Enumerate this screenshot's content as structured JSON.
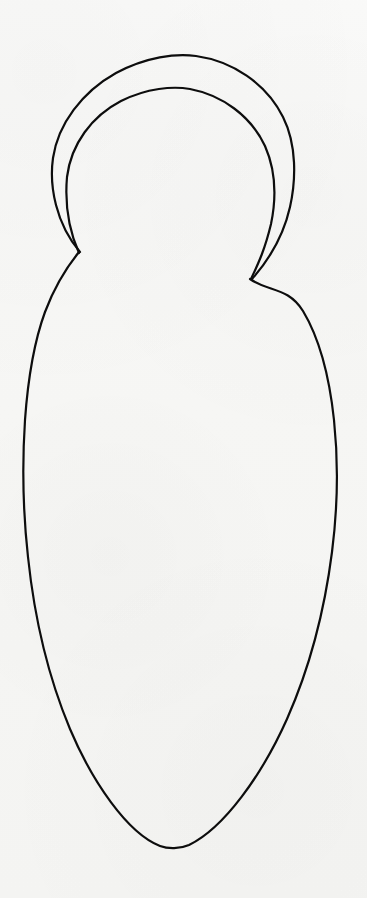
{
  "artwork": {
    "title": "Hand-drawn figure outline",
    "subject": "hooded figure / nesting-doll silhouette",
    "medium": "ink line drawing on paper",
    "canvas": {
      "width": 367,
      "height": 898,
      "background_color": "#fafaf9",
      "paper_tone": "#ffffff"
    },
    "stroke": {
      "color": "#0d0d0d",
      "width": 2.2,
      "linecap": "round",
      "linejoin": "round",
      "fill": "none"
    },
    "parts": [
      {
        "name": "outer-hood-arc",
        "label": "Outer hood / shawl arc",
        "description": "Large outer arc sweeping over the head, ending in the left and right shoulder notches",
        "peak_point": {
          "x": 185,
          "y": 55
        },
        "left_extent_x": 52,
        "right_extent_x": 291,
        "path": "M 80 252 C 56 224 49 186 53 158 C 58 124 82 92 116 73 C 146 57 176 53 196 56 C 232 61 266 83 283 117 C 297 145 296 180 290 207 C 283 238 268 261 252 279"
      },
      {
        "name": "inner-head-arc",
        "label": "Inner head arc",
        "description": "Smaller concentric arc describing the head inside the hood",
        "peak_point": {
          "x": 183,
          "y": 89
        },
        "left_extent_x": 66,
        "right_extent_x": 277,
        "path": "M 79 253 C 68 228 65 200 67 177 C 71 144 92 116 121 101 C 147 88 173 86 190 89 C 222 95 251 116 265 146 C 276 171 276 200 271 224 C 265 249 259 262 251 279"
      },
      {
        "name": "body-outline",
        "label": "Body outline",
        "description": "Wide oval body falling from the shoulder notches to a rounded base",
        "left_notch": {
          "x": 79,
          "y": 252
        },
        "right_notch": {
          "x": 250,
          "y": 279
        },
        "widest_left": {
          "x": 25,
          "y": 520
        },
        "widest_right": {
          "x": 336,
          "y": 492
        },
        "bottom_point": {
          "x": 173,
          "y": 848
        },
        "path": "M 79 252 C 66 268 54 288 45 312 C 34 342 28 378 25 420 C 22 466 23 512 28 557 C 34 614 47 674 70 729 C 92 781 127 833 160 846 C 168 849 180 849 189 845 C 224 828 262 775 287 719 C 310 667 325 607 332 552 C 338 505 338 458 334 420 C 329 373 318 336 303 311 C 288 287 269 292 250 279"
      }
    ],
    "notes": {
      "gap_between_shoulders": "No line connects the two shoulder notches; the neckline is open",
      "line_quality": "slightly wobbly freehand ink line of even weight"
    }
  }
}
